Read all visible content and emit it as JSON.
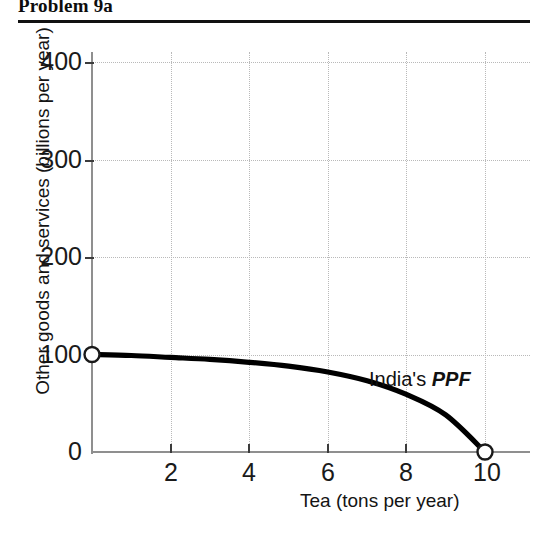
{
  "figure": {
    "title": "Problem 9a"
  },
  "chart_data": {
    "type": "line",
    "title": "Problem 9a",
    "xlabel": "Tea (tons per year)",
    "ylabel": "Other goods and services (billions per year)",
    "xlim": [
      0,
      10
    ],
    "ylim": [
      0,
      400
    ],
    "xticks": [
      "2",
      "4",
      "6",
      "8",
      "10"
    ],
    "xtick_values": [
      2,
      4,
      6,
      8,
      10
    ],
    "yticks": [
      "0",
      "100",
      "200",
      "300",
      "400"
    ],
    "ytick_values": [
      0,
      100,
      200,
      300,
      400
    ],
    "grid": true,
    "legend": "none",
    "annotations": [
      {
        "text_plain": "India's PPF",
        "text_normal": "India's ",
        "text_italic": "PPF",
        "x": 7.2,
        "y": 72
      }
    ],
    "series": [
      {
        "name": "India's PPF",
        "color": "#000000",
        "x": [
          0,
          1,
          2,
          3,
          4,
          5,
          6,
          7,
          8,
          9,
          10
        ],
        "values": [
          100,
          99,
          97,
          95,
          92,
          88,
          82,
          73,
          59,
          38,
          0
        ],
        "endpoint_markers": [
          {
            "x": 0,
            "y": 100,
            "style": "open-circle"
          },
          {
            "x": 10,
            "y": 0,
            "style": "open-circle"
          }
        ]
      }
    ]
  },
  "axis_titles": {
    "x": "Tea (tons per year)",
    "y": "Other goods and services (billions per year)"
  },
  "tick_labels": {
    "y": [
      "400",
      "300",
      "200",
      "100",
      "0"
    ],
    "x": [
      "2",
      "4",
      "6",
      "8",
      "10"
    ]
  },
  "colors": {
    "curve": "#000000",
    "axis": "#8f8f8f",
    "grid": "#b9b9b9",
    "rule": "#111111",
    "footer_bar": "#cbcbcb",
    "text": "#141414"
  }
}
